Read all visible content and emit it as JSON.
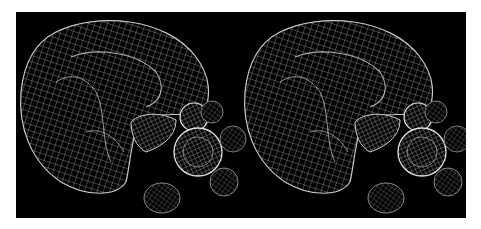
{
  "figure": {
    "type": "stereo-pair",
    "background": "#000000",
    "page_background": "#ffffff",
    "mesh_color": "#d8d8d8",
    "views": [
      {
        "name": "left-eye-view"
      },
      {
        "name": "right-eye-view"
      }
    ]
  }
}
